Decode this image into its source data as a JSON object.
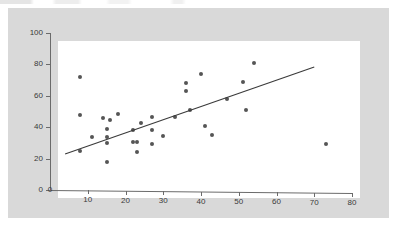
{
  "figure": {
    "background_color": "#d9d9d9",
    "plot_background_color": "#ffffff",
    "marker_color": "#555555",
    "axis_color": "#6b6b6b",
    "trendline_color": "#3a3a3a"
  },
  "chart_data": {
    "type": "scatter",
    "title": "",
    "xlabel": "",
    "ylabel": "",
    "xlim": [
      0,
      80
    ],
    "ylim": [
      0,
      100
    ],
    "xticks": [
      0,
      10,
      20,
      30,
      40,
      50,
      60,
      70,
      80
    ],
    "yticks": [
      0,
      20,
      40,
      60,
      80,
      100
    ],
    "xtick_labels": [
      "0",
      "10",
      "20",
      "30",
      "40",
      "50",
      "60",
      "70",
      "80"
    ],
    "ytick_labels": [
      "0",
      "20",
      "40",
      "60",
      "80",
      "100"
    ],
    "grid": false,
    "legend": null,
    "series": [
      {
        "name": "observations",
        "marker": "circle",
        "color": "#555555",
        "points": [
          [
            8,
            72
          ],
          [
            8,
            48
          ],
          [
            8,
            25
          ],
          [
            11,
            34
          ],
          [
            14,
            46
          ],
          [
            15,
            39
          ],
          [
            15,
            34
          ],
          [
            15,
            30
          ],
          [
            15,
            18
          ],
          [
            16,
            45
          ],
          [
            18,
            49
          ],
          [
            22,
            31
          ],
          [
            22,
            39
          ],
          [
            23,
            31
          ],
          [
            23,
            25
          ],
          [
            24,
            43
          ],
          [
            27,
            47
          ],
          [
            27,
            30
          ],
          [
            27,
            39
          ],
          [
            30,
            35
          ],
          [
            33,
            47
          ],
          [
            36,
            69
          ],
          [
            36,
            64
          ],
          [
            37,
            52
          ],
          [
            40,
            75
          ],
          [
            41,
            42
          ],
          [
            43,
            36
          ],
          [
            47,
            59
          ],
          [
            51,
            70
          ],
          [
            52,
            52
          ],
          [
            54,
            82
          ],
          [
            73,
            31
          ]
        ]
      }
    ],
    "trendline": {
      "type": "linear-fit",
      "x_start": 4,
      "y_start": 23,
      "x_end": 70,
      "y_end": 80
    }
  }
}
